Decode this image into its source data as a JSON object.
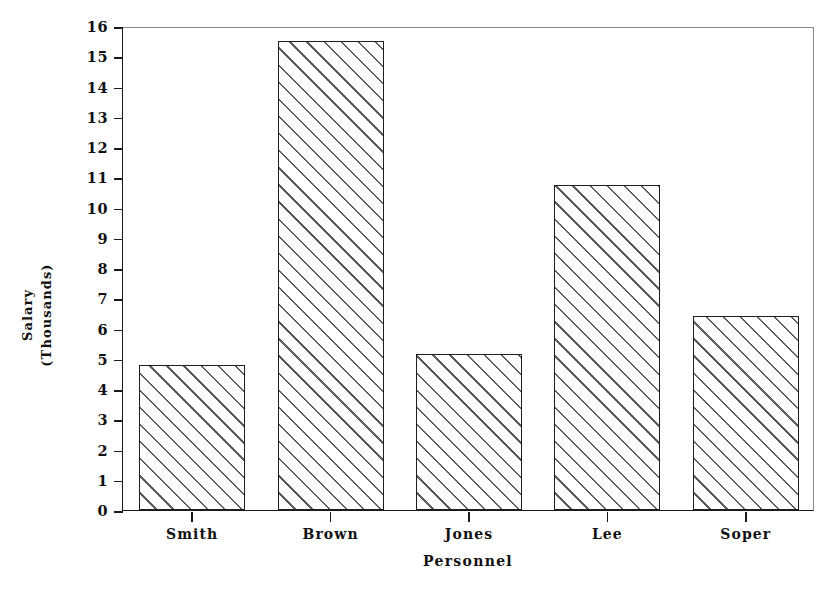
{
  "chart_data": {
    "type": "bar",
    "title": "",
    "categories": [
      "Smith",
      "Brown",
      "Jones",
      "Lee",
      "Soper"
    ],
    "values": [
      4.8,
      15.5,
      5.15,
      10.75,
      6.4
    ],
    "xlabel": "Personnel",
    "ylabel": "Salary (Thousands)",
    "ylabel_lines": [
      "Salary",
      "(Thousands)"
    ],
    "ylim": [
      0,
      16
    ],
    "ytick_labels": [
      "0",
      "1",
      "2",
      "3",
      "4",
      "5",
      "6",
      "7",
      "8",
      "9",
      "10",
      "11",
      "12",
      "13",
      "14",
      "15",
      "16"
    ],
    "ytick_values": [
      0,
      1,
      2,
      3,
      4,
      5,
      6,
      7,
      8,
      9,
      10,
      11,
      12,
      13,
      14,
      15,
      16
    ],
    "grid": false,
    "legend": null,
    "bar_fill": "diagonal-hatch",
    "colors": {
      "axis": "#1a1a1a",
      "bar_edge": "#1f1f1f",
      "bar_hatch": "#5d5d5d",
      "bar_face": "#ffffff",
      "frame_light": "#8a8a8a",
      "background": "#ffffff"
    }
  }
}
